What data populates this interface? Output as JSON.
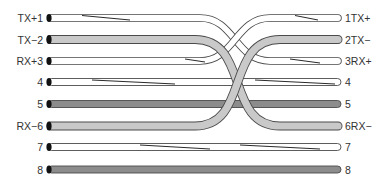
{
  "diagram": {
    "type": "ethernet-crossover-cable-wiring",
    "colors": {
      "white_wire": "#ffffff",
      "light_gray_wire": "#c9c9c9",
      "dark_gray_wire": "#8c8c8c",
      "outline": "#4a4a4a",
      "stripe": "#2a2a2a",
      "left_cap": "#111111"
    },
    "left_pins": [
      {
        "pin": 1,
        "label": "TX+1"
      },
      {
        "pin": 2,
        "label": "TX−2"
      },
      {
        "pin": 3,
        "label": "RX+3"
      },
      {
        "pin": 4,
        "label": "4"
      },
      {
        "pin": 5,
        "label": "5"
      },
      {
        "pin": 6,
        "label": "RX−6"
      },
      {
        "pin": 7,
        "label": "7"
      },
      {
        "pin": 8,
        "label": "8"
      }
    ],
    "right_pins": [
      {
        "pin": 1,
        "label": "1TX+"
      },
      {
        "pin": 2,
        "label": "2TX−"
      },
      {
        "pin": 3,
        "label": "3RX+"
      },
      {
        "pin": 4,
        "label": "4"
      },
      {
        "pin": 5,
        "label": "5"
      },
      {
        "pin": 6,
        "label": "6RX−"
      },
      {
        "pin": 7,
        "label": "7"
      },
      {
        "pin": 8,
        "label": "8"
      }
    ],
    "connections": [
      {
        "from": 1,
        "to": 3,
        "wire": "white-striped"
      },
      {
        "from": 2,
        "to": 6,
        "wire": "light-gray"
      },
      {
        "from": 3,
        "to": 1,
        "wire": "white-striped"
      },
      {
        "from": 4,
        "to": 4,
        "wire": "white-striped"
      },
      {
        "from": 5,
        "to": 5,
        "wire": "dark-gray"
      },
      {
        "from": 6,
        "to": 2,
        "wire": "light-gray"
      },
      {
        "from": 7,
        "to": 7,
        "wire": "white-striped"
      },
      {
        "from": 8,
        "to": 8,
        "wire": "dark-gray"
      }
    ]
  }
}
